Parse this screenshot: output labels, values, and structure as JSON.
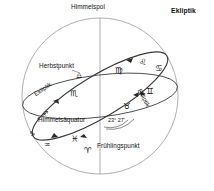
{
  "figure": {
    "kind": "celestial-sphere-diagram",
    "language": "de",
    "stroke_color": "#3b3b3b",
    "sphere_outline_color": "#9a9aa0",
    "background": "#ffffff"
  },
  "labels": {
    "pole": "Himmelspol",
    "ecliptic_corner": "Ekliptik",
    "autumn_point": "Herbstpunkt",
    "spring_point": "Frühlingspunkt",
    "celestial_equator": "Himmelsäquator",
    "ecliptic_left": "Ekliptik",
    "ecliptic_right": "Ekliptik",
    "obliquity_angle": "23° 27'"
  },
  "zodiac": [
    {
      "name": "virgo",
      "symbol": "♍",
      "x": 115,
      "y": 66
    },
    {
      "name": "leo",
      "symbol": "♌",
      "x": 139,
      "y": 58
    },
    {
      "name": "cancer",
      "symbol": "♋",
      "x": 155,
      "y": 64
    },
    {
      "name": "gemini",
      "symbol": "♊",
      "x": 146,
      "y": 87
    },
    {
      "name": "taurus",
      "symbol": "♉",
      "x": 123,
      "y": 102
    },
    {
      "name": "aries",
      "symbol": "♈",
      "x": 84,
      "y": 146
    },
    {
      "name": "pisces",
      "symbol": "♓",
      "x": 71,
      "y": 135
    },
    {
      "name": "aquarius",
      "symbol": "♒",
      "x": 44,
      "y": 142
    },
    {
      "name": "capricorn",
      "symbol": "♑",
      "x": 29,
      "y": 131
    },
    {
      "name": "sagittarius",
      "symbol": "♐",
      "x": 42,
      "y": 111
    },
    {
      "name": "scorpio",
      "symbol": "♏",
      "x": 70,
      "y": 89
    },
    {
      "name": "libra",
      "symbol": "♎",
      "x": 76,
      "y": 73
    }
  ]
}
